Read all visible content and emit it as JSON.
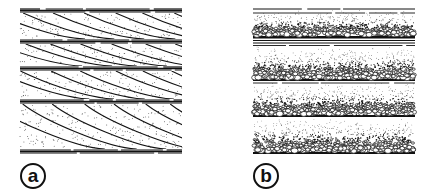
{
  "figure": {
    "panels": [
      {
        "id": "a",
        "label": "a",
        "description": "Stacked cross-bedded sandstone units with inclined foresets between planar bounding surfaces",
        "beds": 4
      },
      {
        "id": "b",
        "label": "b",
        "description": "Stacked normally graded beds: coarse pebbles at base fining upward to fine sand, separated by planar laminae",
        "beds": 4
      }
    ],
    "colors": {
      "ink": "#111111",
      "background": "#ffffff"
    }
  }
}
